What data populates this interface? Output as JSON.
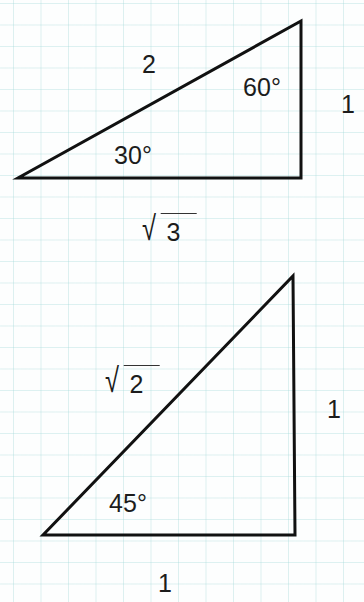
{
  "diagram": {
    "triangles": [
      {
        "name": "30-60-90 triangle",
        "vertices": [
          [
            18,
            178
          ],
          [
            301,
            178
          ],
          [
            301,
            21
          ]
        ],
        "labels": {
          "hypotenuse": "2",
          "opposite_side": "1",
          "adjacent_side_radicand": "3",
          "top_angle": "60°",
          "left_angle": "30°"
        }
      },
      {
        "name": "45-45-90 triangle",
        "vertices": [
          [
            43,
            535
          ],
          [
            295,
            535
          ],
          [
            293,
            276
          ]
        ],
        "labels": {
          "hypotenuse_radicand": "2",
          "vertical_side": "1",
          "base_side": "1",
          "left_angle": "45°"
        }
      }
    ],
    "radical_symbol": "√",
    "colors": {
      "line": "#111111",
      "grid": "#a0d7d7",
      "background": "#fdfefe"
    }
  }
}
